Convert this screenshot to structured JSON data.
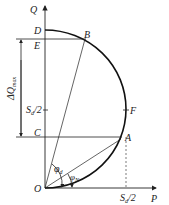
{
  "axes": {
    "q_label": "Q",
    "p_label": "P",
    "origin_label": "O"
  },
  "points": {
    "D": "D",
    "E": "E",
    "C": "C",
    "B": "B",
    "F": "F",
    "A": "A"
  },
  "labels": {
    "delta_q_max": "ΔQ",
    "delta_q_max_sub": "max",
    "s_half_q": "S",
    "s_half_q_sub": "d",
    "s_half_q_suffix": "/2",
    "s_half_p": "S",
    "s_half_p_sub": "d",
    "s_half_p_suffix": "/2",
    "phi_d": "φ",
    "phi_d_sub": "d",
    "phi_n": "φ",
    "phi_n_sub": "N"
  },
  "colors": {
    "line": "#222222",
    "arc": "#111111"
  }
}
